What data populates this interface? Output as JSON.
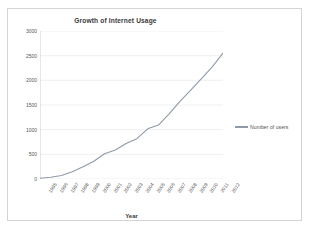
{
  "chart_data": {
    "type": "line",
    "title": "Growth of Internet Usage",
    "xlabel": "Year",
    "ylabel": "Millions of users",
    "legend": [
      "Number of users"
    ],
    "legend_position": "right",
    "grid": true,
    "line_color": "#8e9aa8",
    "categories": [
      "1995",
      "1996",
      "1997",
      "1998",
      "1999",
      "2000",
      "2001",
      "2002",
      "2003",
      "2004",
      "2005",
      "2006",
      "2007",
      "2008",
      "2009",
      "2010",
      "2011",
      "2012"
    ],
    "x": [
      1995,
      1996,
      1997,
      1998,
      1999,
      2000,
      2001,
      2002,
      2003,
      2004,
      2005,
      2006,
      2007,
      2008,
      2009,
      2010,
      2011,
      2012
    ],
    "series": [
      {
        "name": "Number of users",
        "values": [
          16,
          36,
          70,
          147,
          248,
          361,
          513,
          587,
          719,
          817,
          1018,
          1093,
          1319,
          1574,
          1802,
          2034,
          2272,
          2551
        ]
      }
    ],
    "ylim": [
      0,
      3000
    ],
    "ytick_labels": [
      "0",
      "500",
      "1000",
      "1500",
      "2000",
      "2500",
      "3000"
    ],
    "yticks": [
      0,
      500,
      1000,
      1500,
      2000,
      2500,
      3000
    ],
    "xlim": [
      1995,
      2012
    ]
  }
}
